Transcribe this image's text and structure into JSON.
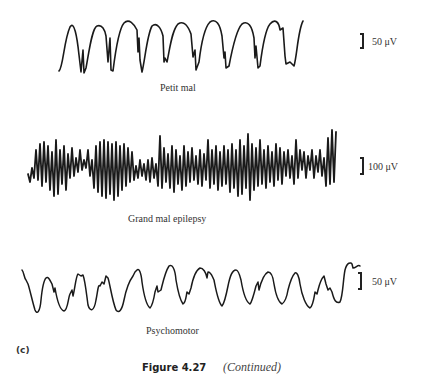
{
  "traces": [
    {
      "name": "Petit mal",
      "label": "Petit mal",
      "scale_value": "50 μV",
      "description": "Regular spike-and-wave pattern, ~9 rounded waves with sharp spikes"
    },
    {
      "name": "Grand mal epilepsy",
      "label": "Grand mal epilepsy",
      "scale_value": "100 μV",
      "description": "Dense, high-frequency, high-amplitude irregular activity"
    },
    {
      "name": "Psychomotor",
      "label": "Psychomotor",
      "scale_value": "50 μV",
      "description": "Irregular rounded waves with notched shoulders, ~11 cycles"
    }
  ],
  "panel_letter": "(c)",
  "caption": {
    "figure_number": "Figure 4.27",
    "note": "(Continued)"
  }
}
